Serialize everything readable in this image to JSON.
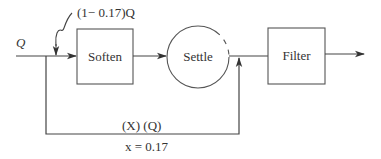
{
  "diagram": {
    "title": "",
    "nodes": [
      {
        "id": "soften",
        "label": "Soften",
        "shape": "rectangle"
      },
      {
        "id": "settle",
        "label": "Settle",
        "shape": "circle"
      },
      {
        "id": "filter",
        "label": "Filter",
        "shape": "rectangle"
      }
    ],
    "edges": [
      {
        "from": "input",
        "to": "soften",
        "label": "Q"
      },
      {
        "from": "soften",
        "to": "settle",
        "label": ""
      },
      {
        "from": "settle",
        "to": "filter",
        "label": ""
      },
      {
        "from": "filter",
        "to": "output",
        "label": ""
      },
      {
        "from": "input",
        "to": "settle-outlet",
        "label": "(X) (Q)",
        "type": "bypass"
      }
    ],
    "labels": {
      "input_flow": "Q",
      "soften_flow": "(1− 0.17)Q",
      "bypass_flow": "(X) (Q)",
      "bypass_fraction": "x = 0.17"
    },
    "colors": {
      "line": "#444444",
      "text": "#333333",
      "background": "#ffffff"
    }
  }
}
